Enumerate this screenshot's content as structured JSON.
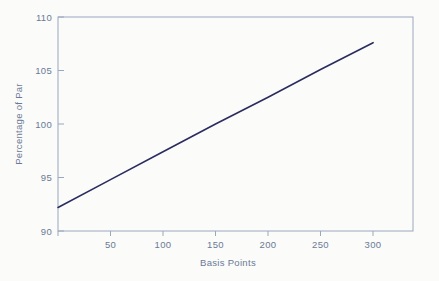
{
  "chart_data": {
    "type": "line",
    "title": "",
    "xlabel": "Basis Points",
    "ylabel": "Percentage of Par",
    "xlim": [
      0,
      338
    ],
    "ylim": [
      90,
      110
    ],
    "xticks": [
      50,
      100,
      150,
      200,
      250,
      300
    ],
    "xtick_labels": [
      "50",
      "100",
      "150",
      "200",
      "250",
      "300"
    ],
    "yticks": [
      90,
      95,
      100,
      105,
      110
    ],
    "ytick_labels": [
      "90",
      "95",
      "100",
      "105",
      "110"
    ],
    "grid": false,
    "legend": "none",
    "series": [
      {
        "name": "Price vs Basis Points",
        "color": "#2a2c5e",
        "x": [
          0,
          50,
          100,
          150,
          200,
          250,
          300
        ],
        "values": [
          92.2,
          94.8,
          97.4,
          100.0,
          102.5,
          105.1,
          107.6
        ]
      }
    ]
  },
  "axes": {
    "x_title": "Basis Points",
    "y_title": "Percentage of Par"
  },
  "ticks": {
    "x": [
      {
        "label": "50",
        "value": 50
      },
      {
        "label": "100",
        "value": 100
      },
      {
        "label": "150",
        "value": 150
      },
      {
        "label": "200",
        "value": 200
      },
      {
        "label": "250",
        "value": 250
      },
      {
        "label": "300",
        "value": 300
      }
    ],
    "y": [
      {
        "label": "110",
        "value": 110
      },
      {
        "label": "105",
        "value": 105
      },
      {
        "label": "100",
        "value": 100
      },
      {
        "label": "95",
        "value": 95
      },
      {
        "label": "90",
        "value": 90
      }
    ]
  },
  "colors": {
    "background": "#fbfbfa",
    "frame": "#9aa8bd",
    "text": "#6a7a95",
    "line": "#2a2c5e"
  }
}
